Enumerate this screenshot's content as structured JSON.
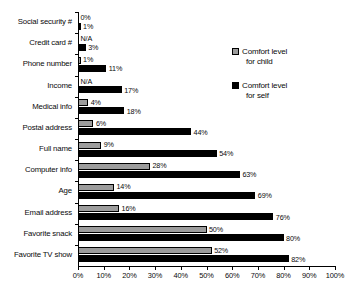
{
  "chart_data": {
    "type": "bar",
    "orientation": "horizontal",
    "title": "",
    "xlabel": "",
    "ylabel": "",
    "xlim": [
      0,
      100
    ],
    "xticks": [
      "0%",
      "10%",
      "20%",
      "30%",
      "40%",
      "50%",
      "60%",
      "70%",
      "80%",
      "90%",
      "100%"
    ],
    "grid": false,
    "legend_position": "upper-right",
    "categories": [
      "Social security #",
      "Credit card #",
      "Phone number",
      "Income",
      "Medical info",
      "Postal address",
      "Full name",
      "Computer info",
      "Age",
      "Email address",
      "Favorite snack",
      "Favorite TV show"
    ],
    "series": [
      {
        "name": "Comfort level for child",
        "values": [
          0,
          null,
          1,
          null,
          4,
          6,
          9,
          28,
          14,
          16,
          50,
          52
        ],
        "labels": [
          "0%",
          "N/A",
          "1%",
          "N/A",
          "4%",
          "6%",
          "9%",
          "28%",
          "14%",
          "16%",
          "50%",
          "52%"
        ],
        "color": "#9c9c9c"
      },
      {
        "name": "Comfort level for self",
        "values": [
          1,
          3,
          11,
          17,
          18,
          44,
          54,
          63,
          69,
          76,
          80,
          82
        ],
        "labels": [
          "1%",
          "3%",
          "11%",
          "17%",
          "18%",
          "44%",
          "54%",
          "63%",
          "69%",
          "76%",
          "80%",
          "82%"
        ],
        "color": "#000000"
      }
    ]
  },
  "legend": {
    "items": [
      {
        "line1": "Comfort level",
        "line2": "for child",
        "swatch": "child"
      },
      {
        "line1": "Comfort level",
        "line2": "for self",
        "swatch": "self"
      }
    ]
  },
  "caption": {
    "text": ""
  }
}
